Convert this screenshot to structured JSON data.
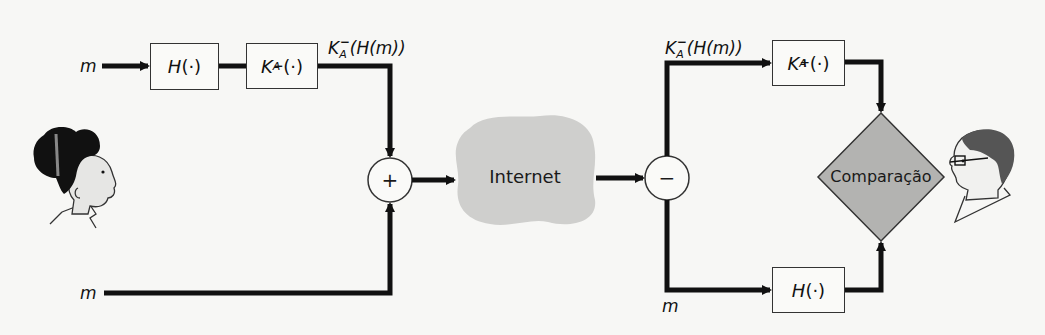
{
  "diagram": {
    "sender": {
      "inputs": [
        {
          "label": "m",
          "position": "top"
        },
        {
          "label": "m",
          "position": "bottom"
        }
      ],
      "hash_box": {
        "label_main": "H",
        "label_arg": "(·)"
      },
      "sign_box": {
        "label_main": "K",
        "label_sub": "A",
        "label_sup": "−",
        "label_arg": "(·)"
      },
      "signature_label": {
        "main": "K",
        "sub": "A",
        "sup": "−",
        "arg": "(H(m))"
      },
      "combiner": {
        "symbol": "+"
      }
    },
    "network": {
      "label": "Internet"
    },
    "receiver": {
      "splitter": {
        "symbol": "−"
      },
      "signature_label": {
        "main": "K",
        "sub": "A",
        "sup": "−",
        "arg": "(H(m))"
      },
      "verify_box": {
        "label_main": "K",
        "label_sub": "A",
        "label_sup": "+",
        "label_arg": "(·)"
      },
      "message_label": "m",
      "hash_box": {
        "label_main": "H",
        "label_arg": "(·)"
      },
      "compare": {
        "label": "Comparação"
      }
    },
    "people": [
      {
        "name": "alice-figure",
        "side": "left"
      },
      {
        "name": "bob-figure",
        "side": "right"
      }
    ],
    "colors": {
      "background": "#f7f7f5",
      "line": "#111111",
      "cloud": "#cfcfcd",
      "diamond": "#b3b3b1",
      "box_border": "#333333"
    }
  }
}
